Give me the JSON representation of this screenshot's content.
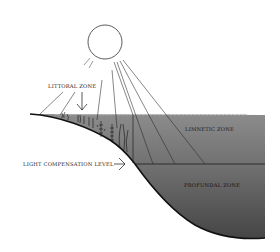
{
  "diagram": {
    "labels": {
      "littoral": "LITTORAL ZONE",
      "limnetic": "LIMNETIC ZONE",
      "profundal": "PROFUNDAL ZONE",
      "light_compensation": "LIGHT COMPENSATION LEVEL"
    },
    "icons": [
      "sun-icon",
      "arrow-down-icon",
      "arrow-right-icon",
      "aquatic-plant-icon"
    ],
    "colors": {
      "water_top": "#8a8a8a",
      "water_bottom": "#4a4a4a",
      "line": "#1a1a1a",
      "background": "#ffffff"
    }
  }
}
